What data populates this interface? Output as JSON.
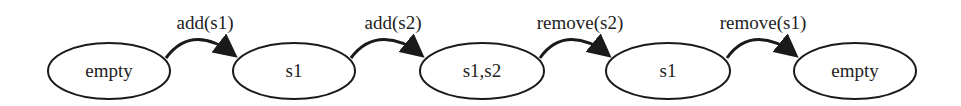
{
  "diagram": {
    "type": "state-transition",
    "nodes": [
      {
        "id": "n0",
        "label": "empty",
        "cx": 109,
        "cy": 71
      },
      {
        "id": "n1",
        "label": "s1",
        "cx": 294,
        "cy": 71
      },
      {
        "id": "n2",
        "label": "s1,s2",
        "cx": 482,
        "cy": 71
      },
      {
        "id": "n3",
        "label": "s1",
        "cx": 668,
        "cy": 71
      },
      {
        "id": "n4",
        "label": "empty",
        "cx": 855,
        "cy": 71
      }
    ],
    "edges": [
      {
        "from": "n0",
        "to": "n1",
        "label": "add(s1)"
      },
      {
        "from": "n1",
        "to": "n2",
        "label": "add(s2)"
      },
      {
        "from": "n2",
        "to": "n3",
        "label": "remove(s2)"
      },
      {
        "from": "n3",
        "to": "n4",
        "label": "remove(s1)"
      }
    ],
    "colors": {
      "stroke": "#1a1a1a",
      "background": "#ffffff"
    }
  }
}
